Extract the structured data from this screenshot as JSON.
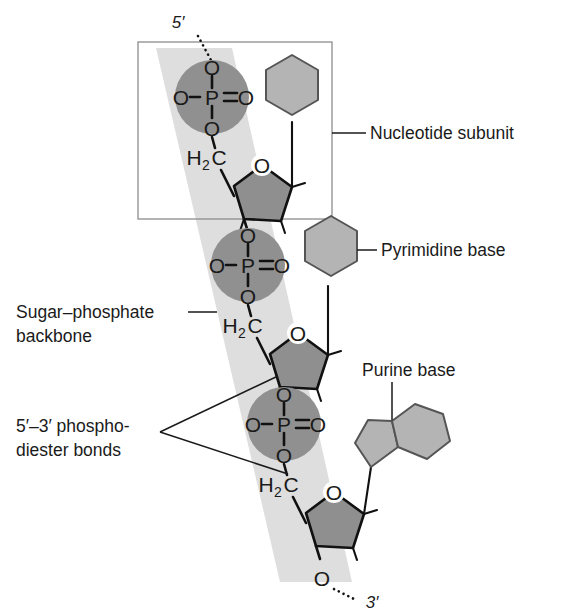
{
  "figure": {
    "background_color": "#ffffff"
  },
  "colors": {
    "backbone_band": "#dcdcdc",
    "phosphate_circle": "#909090",
    "sugar_ring": "#8f8f8f",
    "base_fill": "#b4b4b4",
    "base_stroke": "#555555",
    "bond_stroke": "#111111",
    "text": "#1a1a1a",
    "box_stroke": "#8d8d8d"
  },
  "end_labels": {
    "five_prime": "5′",
    "three_prime": "3′"
  },
  "callouts": [
    {
      "id": "nucleotide-subunit",
      "label": "Nucleotide subunit",
      "x": 370,
      "y": 133
    },
    {
      "id": "pyrimidine-base",
      "label": "Pyrimidine base",
      "x": 381,
      "y": 256
    },
    {
      "id": "purine-base",
      "label": "Purine base",
      "x": 362,
      "y": 375
    },
    {
      "id": "sugar-phosphate-backbone",
      "label_line1": "Sugar–phosphate",
      "label_line2": "backbone",
      "x": 16,
      "y": 312
    },
    {
      "id": "phosphodiester-bonds",
      "label_line1": "5′–3′ phospho-",
      "label_line2": "diester bonds",
      "x": 16,
      "y": 426
    }
  ],
  "atoms": {
    "oxygen": "O",
    "phosphorus": "P",
    "methylene_main": "H",
    "methylene_sub": "2",
    "methylene_carbon": "C"
  },
  "nucleotides": [
    {
      "index": 1,
      "base_type": "pyrimidine",
      "phosphate_center": [
        212,
        97
      ],
      "sugar_center": [
        262,
        190
      ],
      "base_center": [
        292,
        90
      ]
    },
    {
      "index": 2,
      "base_type": "pyrimidine",
      "phosphate_center": [
        248,
        265
      ],
      "sugar_center": [
        297,
        345
      ],
      "base_center": [
        331,
        251
      ]
    },
    {
      "index": 3,
      "base_type": "purine",
      "phosphate_center": [
        284,
        424
      ],
      "sugar_center": [
        333,
        513
      ],
      "base_center": [
        404,
        440
      ]
    }
  ]
}
